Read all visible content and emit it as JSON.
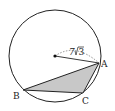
{
  "diagram": {
    "type": "circle-inscribed-triangle",
    "circle": {
      "cx": 55,
      "cy": 56,
      "r": 46
    },
    "center": {
      "x": 55,
      "y": 56
    },
    "points": {
      "A": {
        "x": 99,
        "y": 63,
        "label": "A"
      },
      "B": {
        "x": 23,
        "y": 90,
        "label": "B"
      },
      "C": {
        "x": 83,
        "y": 93,
        "label": "C"
      }
    },
    "radius_label": "7√3",
    "radius_label_coeff": "7",
    "radius_label_rad": "3",
    "triangle_fill": "#c8c8c8",
    "stroke": "#222222"
  }
}
